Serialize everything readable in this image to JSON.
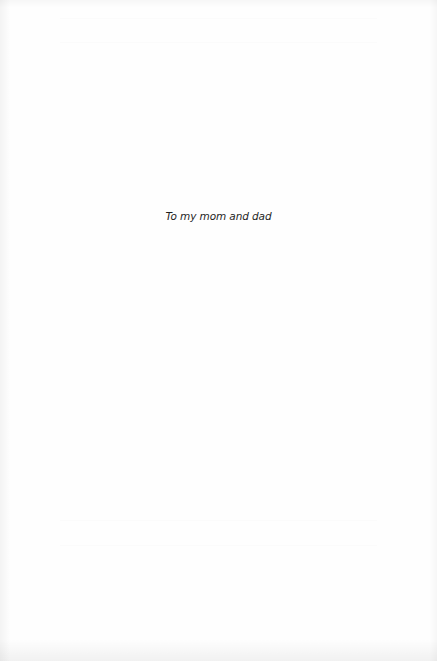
{
  "page": {
    "type": "dedication",
    "background_color": "#fefefe",
    "text_color": "#1e1e1e"
  },
  "dedication": {
    "text": "To my mom and dad"
  }
}
